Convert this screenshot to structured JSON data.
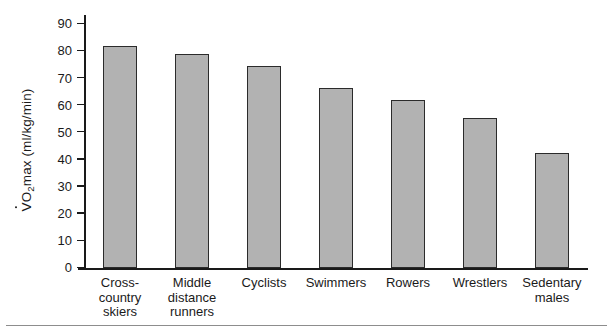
{
  "chart_data": {
    "type": "bar",
    "title": "",
    "subtitle": "",
    "xlabel": "",
    "ylabel": "VO2max (ml/kg/min)",
    "ylabel_parts": {
      "v": "V",
      "o": "O",
      "sub": "2",
      "rest": "max (ml/kg/min)"
    },
    "categories": [
      "Cross-\ncountry\nskiers",
      "Middle\ndistance\nrunners",
      "Cyclists",
      "Swimmers",
      "Rowers",
      "Wrestlers",
      "Sedentary\nmales"
    ],
    "values": [
      82,
      79,
      74.5,
      66.5,
      62,
      55.5,
      42.5
    ],
    "ylim": [
      0,
      90
    ],
    "yticks": [
      0,
      10,
      20,
      30,
      40,
      50,
      60,
      70,
      80,
      90
    ],
    "ytick_labels": [
      "0",
      "10",
      "20",
      "30",
      "40",
      "50",
      "60",
      "70",
      "80",
      "90"
    ],
    "grid": false,
    "legend": null,
    "bar_color": "#b2b2b2",
    "bar_edge_color": "#2b2b2b",
    "axis_color": "#1a1a1a",
    "background": "#ffffff"
  }
}
